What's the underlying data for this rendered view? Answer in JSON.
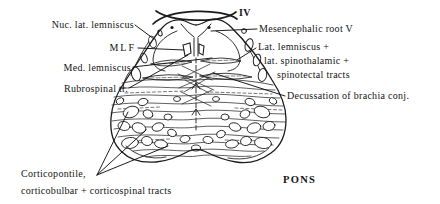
{
  "figure": {
    "type": "anatomical line drawing, brainstem cross-section",
    "colors": {
      "ink": "#1b1b1b",
      "background": "#ffffff"
    },
    "labels": {
      "nuc_lat_lemniscus": "Nuc. lat. lemniscus",
      "mlf": "MLF",
      "med_lemniscus": "Med. lemniscus",
      "rubrospinal_tr": "Rubrospinal tr.",
      "trochlear_iv": "IV",
      "mesencephalic_root_v": "Mesencephalic root V",
      "lat_lemniscus_line1": "Lat. lemniscus +",
      "lat_lemniscus_line2": "lat. spinothalamic +",
      "lat_lemniscus_line3": "spinotectal tracts",
      "decussation_brachia": "Decussation of brachia conj.",
      "corticopontile_line1": "Corticopontile,",
      "corticopontile_line2": "corticobulbar + corticospinal tracts",
      "pons": "PONS"
    }
  }
}
